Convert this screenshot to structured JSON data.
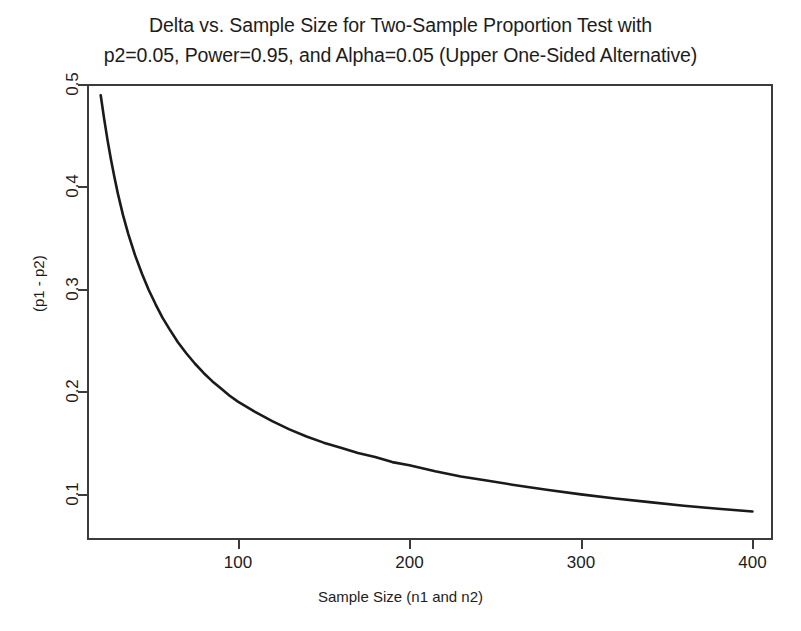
{
  "chart_data": {
    "type": "line",
    "title": "Delta vs. Sample Size for Two-Sample Proportion Test with p2=0.05, Power=0.95, and Alpha=0.05 (Upper One-Sided Alternative)",
    "title_line_1": "Delta vs. Sample Size for Two-Sample Proportion Test with",
    "title_line_2": "p2=0.05, Power=0.95, and Alpha=0.05 (Upper One-Sided Alternative)",
    "xlabel": "Sample Size (n1 and n2)",
    "ylabel": "(p1 - p2)",
    "xlim": [
      12,
      412
    ],
    "ylim": [
      0.055,
      0.5
    ],
    "grid": false,
    "legend": "none",
    "line_color": "#1a1a1a",
    "xticks": [
      100,
      200,
      300,
      400
    ],
    "xtick_labels": [
      "100",
      "200",
      "300",
      "400"
    ],
    "yticks": [
      0.1,
      0.2,
      0.3,
      0.4,
      0.5
    ],
    "ytick_labels": [
      "0.1",
      "0.2",
      "0.3",
      "0.4",
      "0.5"
    ],
    "series": [
      {
        "name": "delta",
        "x": [
          20,
          22,
          24,
          26,
          28,
          30,
          33,
          36,
          40,
          44,
          48,
          52,
          56,
          60,
          65,
          70,
          75,
          80,
          85,
          90,
          95,
          100,
          110,
          120,
          130,
          140,
          150,
          160,
          170,
          180,
          190,
          200,
          215,
          230,
          245,
          260,
          280,
          300,
          320,
          340,
          360,
          380,
          400
        ],
        "y": [
          0.489,
          0.466,
          0.445,
          0.426,
          0.409,
          0.393,
          0.372,
          0.354,
          0.333,
          0.315,
          0.299,
          0.285,
          0.272,
          0.261,
          0.248,
          0.237,
          0.227,
          0.218,
          0.21,
          0.203,
          0.196,
          0.19,
          0.18,
          0.171,
          0.163,
          0.156,
          0.15,
          0.145,
          0.14,
          0.136,
          0.131,
          0.128,
          0.122,
          0.117,
          0.113,
          0.109,
          0.104,
          0.0995,
          0.0955,
          0.092,
          0.0885,
          0.0855,
          0.0828
        ]
      }
    ]
  }
}
